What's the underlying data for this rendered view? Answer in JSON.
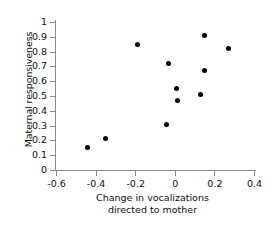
{
  "chart_data": {
    "type": "scatter",
    "title": "",
    "xlabel": "Change in vocalizations directed to mother",
    "xlabel_lines": [
      "Change in vocalizations",
      "directed to mother"
    ],
    "ylabel": "Maternal responsiveness",
    "xlim": [
      -0.6,
      0.4
    ],
    "ylim": [
      0,
      1
    ],
    "xticks": [
      -0.6,
      -0.4,
      -0.2,
      0,
      0.2,
      0.4
    ],
    "xtick_labels": [
      "-0.6",
      "-0.4",
      "-0.2",
      "0",
      "0.2",
      "0.4"
    ],
    "yticks": [
      0,
      0.1,
      0.2,
      0.3,
      0.4,
      0.5,
      0.6,
      0.7,
      0.8,
      0.9,
      1
    ],
    "ytick_labels": [
      "0",
      "0.1",
      "0.2",
      "0.3",
      "0.4",
      "0.5",
      "0.6",
      "0.7",
      "0.8",
      "0.9",
      "1"
    ],
    "grid": false,
    "legend": false,
    "marker": "filled-circle",
    "marker_color": "#000000",
    "axis_color": "#8a8a8a",
    "n_points": 11,
    "x": [
      -0.44,
      -0.35,
      -0.19,
      -0.04,
      -0.03,
      0.01,
      0.015,
      0.13,
      0.15,
      0.15,
      0.27
    ],
    "y": [
      0.15,
      0.21,
      0.85,
      0.31,
      0.72,
      0.55,
      0.47,
      0.51,
      0.67,
      0.91,
      0.82
    ],
    "points": [
      {
        "x": -0.44,
        "y": 0.15
      },
      {
        "x": -0.35,
        "y": 0.21
      },
      {
        "x": -0.19,
        "y": 0.85
      },
      {
        "x": -0.04,
        "y": 0.31
      },
      {
        "x": -0.03,
        "y": 0.72
      },
      {
        "x": 0.01,
        "y": 0.55
      },
      {
        "x": 0.015,
        "y": 0.47
      },
      {
        "x": 0.13,
        "y": 0.51
      },
      {
        "x": 0.15,
        "y": 0.67
      },
      {
        "x": 0.15,
        "y": 0.91
      },
      {
        "x": 0.27,
        "y": 0.82
      }
    ]
  }
}
